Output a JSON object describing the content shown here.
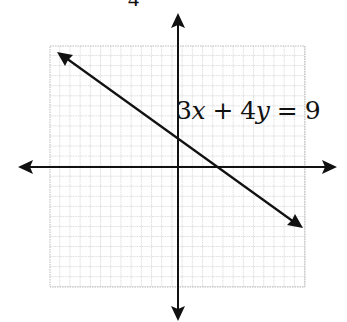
{
  "figure": {
    "top_fragment_text": "4",
    "equation": {
      "coef_x": "3",
      "var_x": "x",
      "op": " + ",
      "coef_y": "4",
      "var_y": "y",
      "eq": " = ",
      "rhs": "9"
    },
    "grid": {
      "left": 50,
      "top": 46,
      "right": 305,
      "bottom": 287,
      "cell": 10.2,
      "color": "#9a9a9a"
    },
    "axes": {
      "origin_x": 178,
      "origin_y": 167,
      "color": "#111111"
    },
    "line": {
      "x1": 57,
      "y1": 52,
      "x2": 303,
      "y2": 228
    }
  }
}
